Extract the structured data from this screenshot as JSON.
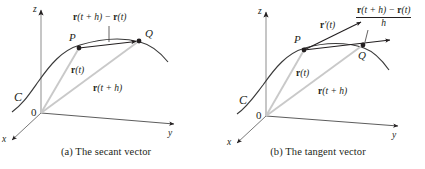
{
  "figure": {
    "background": "#ffffff",
    "ink_color": "#231f20",
    "vector_color": "#c9c9c9",
    "curve_color": "#3a3a3a"
  },
  "panels": [
    {
      "id": "a",
      "caption": "(a) The secant vector",
      "axes": [
        {
          "name": "z-axis",
          "label": "z"
        },
        {
          "name": "y-axis",
          "label": "y"
        },
        {
          "name": "x-axis",
          "label": "x"
        }
      ],
      "origin_label": "0",
      "curve_label": "C",
      "points": [
        {
          "name": "point-p",
          "label": "P"
        },
        {
          "name": "point-q",
          "label": "Q"
        }
      ],
      "vectors": [
        {
          "name": "position-vector-t",
          "label_bold": "r",
          "label_rest": "(t)"
        },
        {
          "name": "position-vector-t-plus-h",
          "label_bold": "r",
          "label_rest": "(t + h)"
        },
        {
          "name": "secant-vector",
          "label_parts": [
            "r",
            "(t + h) − ",
            "r",
            "(t)"
          ]
        }
      ]
    },
    {
      "id": "b",
      "caption": "(b) The tangent vector",
      "axes": [
        {
          "name": "z-axis",
          "label": "z"
        },
        {
          "name": "y-axis",
          "label": "y"
        },
        {
          "name": "x-axis",
          "label": "x"
        }
      ],
      "origin_label": "0",
      "curve_label": "C",
      "points": [
        {
          "name": "point-p",
          "label": "P"
        },
        {
          "name": "point-q",
          "label": "Q"
        }
      ],
      "vectors": [
        {
          "name": "position-vector-t",
          "label_bold": "r",
          "label_rest": "(t)"
        },
        {
          "name": "position-vector-t-plus-h",
          "label_bold": "r",
          "label_rest": "(t + h)"
        },
        {
          "name": "tangent-vector",
          "label_bold": "r",
          "label_rest": "′(t)"
        },
        {
          "name": "difference-quotient-vector",
          "numerator_parts": [
            "r",
            "(t + h) − ",
            "r",
            "(t)"
          ],
          "denominator": "h",
          "leader_label": "h"
        }
      ]
    }
  ],
  "text": {
    "a": {
      "caption": "(a) The secant vector",
      "axis_z": "z",
      "axis_y": "y",
      "axis_x": "x",
      "origin": "0",
      "curve": "C",
      "point_p": "P",
      "point_q": "Q",
      "vec_r_t_bold": "r",
      "vec_r_t_rest": "(t)",
      "vec_r_th_bold": "r",
      "vec_r_th_rest": "(t + h)",
      "secant_p1": "r",
      "secant_p2": "(t + h) − ",
      "secant_p3": "r",
      "secant_p4": "(t)"
    },
    "b": {
      "caption": "(b) The tangent vector",
      "axis_z": "z",
      "axis_y": "y",
      "axis_x": "x",
      "origin": "0",
      "curve": "C",
      "point_p": "P",
      "point_q": "Q",
      "vec_r_t_bold": "r",
      "vec_r_t_rest": "(t)",
      "vec_r_th_bold": "r",
      "vec_r_th_rest": "(t + h)",
      "tangent_bold": "r",
      "tangent_rest": "′(t)",
      "num_p1": "r",
      "num_p2": "(t + h) − ",
      "num_p3": "r",
      "num_p4": "(t)",
      "denominator": "h",
      "leader_h": "h"
    }
  }
}
